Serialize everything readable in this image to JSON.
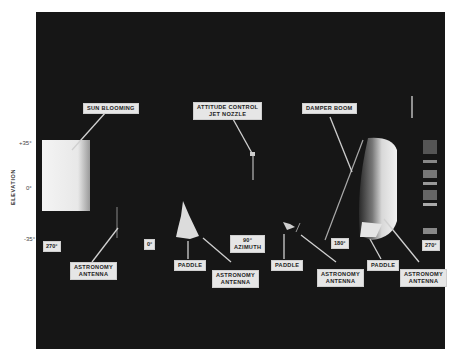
{
  "figure": {
    "elevation_axis": {
      "title": "ELEVATION",
      "ticks": [
        "+35°",
        "0°",
        "-35°"
      ]
    },
    "callouts": [
      {
        "id": "sun-blooming",
        "text": "SUN BLOOMING"
      },
      {
        "id": "attitude-control",
        "line1": "ATTITUDE CONTROL",
        "line2": "JET NOZZLE"
      },
      {
        "id": "damper-boom",
        "text": "DAMPER BOOM"
      },
      {
        "id": "astronomy-antenna-1",
        "line1": "ASTRONOMY",
        "line2": "ANTENNA"
      },
      {
        "id": "paddle-1",
        "text": "PADDLE"
      },
      {
        "id": "astronomy-antenna-2",
        "line1": "ASTRONOMY",
        "line2": "ANTENNA"
      },
      {
        "id": "azimuth-90",
        "line1": "90°",
        "line2": "AZIMUTH"
      },
      {
        "id": "paddle-2",
        "text": "PADDLE"
      },
      {
        "id": "astronomy-antenna-3",
        "line1": "ASTRONOMY",
        "line2": "ANTENNA"
      },
      {
        "id": "paddle-3",
        "text": "PADDLE"
      },
      {
        "id": "astronomy-antenna-4",
        "line1": "ASTRONOMY",
        "line2": "ANTENNA"
      }
    ],
    "azimuth_markers": [
      "270°",
      "0°",
      "180°",
      "270°"
    ]
  }
}
